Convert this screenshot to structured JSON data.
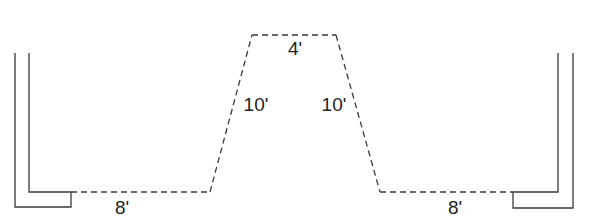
{
  "diagram": {
    "line_color": "#3a3a3a",
    "labels": {
      "left_bottom": "8'",
      "left_slope": "10'",
      "top": "4'",
      "right_slope": "10'",
      "right_bottom": "8'"
    }
  }
}
